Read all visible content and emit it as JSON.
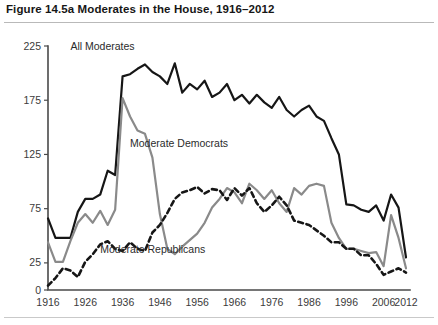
{
  "figure": {
    "title": "Figure 14.5a  Moderates in the House, 1916–2012"
  },
  "axes": {
    "y_ticks": [
      "0",
      "25",
      "75",
      "125",
      "175",
      "225"
    ],
    "x_ticks": [
      "1916",
      "1926",
      "1936",
      "1946",
      "1956",
      "1966",
      "1976",
      "1986",
      "1996",
      "2006",
      "2012"
    ]
  },
  "series_labels": {
    "all": "All Moderates",
    "democrats": "Moderate Democrats",
    "republicans": "Moderate Republicans"
  },
  "colors": {
    "all_moderates": "#161616",
    "moderate_democrats": "#8a8a8a",
    "moderate_republicans": "#161616",
    "axis": "#4a4a4a",
    "rule": "#b9b9b9"
  },
  "chart_data": {
    "type": "line",
    "title": "Figure 14.5a  Moderates in the House, 1916–2012",
    "xlabel": "",
    "ylabel": "",
    "xlim": [
      1916,
      2012
    ],
    "ylim": [
      0,
      225
    ],
    "grid": false,
    "legend": "inline-annotations",
    "x": [
      1916,
      1918,
      1920,
      1922,
      1924,
      1926,
      1928,
      1930,
      1932,
      1934,
      1936,
      1938,
      1940,
      1942,
      1944,
      1946,
      1948,
      1950,
      1952,
      1954,
      1956,
      1958,
      1960,
      1962,
      1964,
      1966,
      1968,
      1970,
      1972,
      1974,
      1976,
      1978,
      1980,
      1982,
      1984,
      1986,
      1988,
      1990,
      1992,
      1994,
      1996,
      1998,
      2000,
      2002,
      2004,
      2006,
      2008,
      2010,
      2012
    ],
    "series": [
      {
        "name": "All Moderates",
        "style": "solid",
        "color": "#161616",
        "values": [
          66,
          48,
          48,
          48,
          72,
          84,
          84,
          88,
          110,
          106,
          197,
          199,
          204,
          208,
          201,
          197,
          190,
          209,
          182,
          190,
          185,
          193,
          178,
          182,
          190,
          175,
          180,
          172,
          180,
          173,
          168,
          178,
          166,
          160,
          166,
          170,
          160,
          156,
          140,
          125,
          79,
          78,
          74,
          72,
          78,
          64,
          88,
          76,
          30
        ]
      },
      {
        "name": "Moderate Democrats",
        "style": "solid",
        "color": "#8a8a8a",
        "values": [
          44,
          26,
          26,
          45,
          62,
          70,
          62,
          73,
          60,
          74,
          177,
          160,
          147,
          144,
          122,
          70,
          38,
          33,
          40,
          46,
          52,
          62,
          76,
          84,
          94,
          90,
          80,
          98,
          92,
          84,
          92,
          80,
          72,
          94,
          88,
          96,
          98,
          96,
          62,
          48,
          38,
          38,
          36,
          34,
          35,
          22,
          69,
          48,
          20
        ]
      },
      {
        "name": "Moderate Republicans",
        "style": "dashed",
        "color": "#161616",
        "values": [
          4,
          11,
          20,
          18,
          12,
          26,
          33,
          42,
          45,
          38,
          36,
          44,
          38,
          36,
          53,
          60,
          71,
          84,
          90,
          92,
          95,
          89,
          93,
          92,
          83,
          94,
          87,
          94,
          80,
          72,
          78,
          86,
          78,
          64,
          62,
          60,
          55,
          50,
          44,
          44,
          38,
          38,
          32,
          32,
          24,
          14,
          17,
          20,
          16
        ]
      }
    ],
    "annotations": [
      {
        "text": "All Moderates",
        "x": 1922,
        "y": 221
      },
      {
        "text": "Moderate Democrats",
        "x": 1938,
        "y": 132
      },
      {
        "text": "Moderate Republicans",
        "x": 1930,
        "y": 34
      }
    ]
  }
}
